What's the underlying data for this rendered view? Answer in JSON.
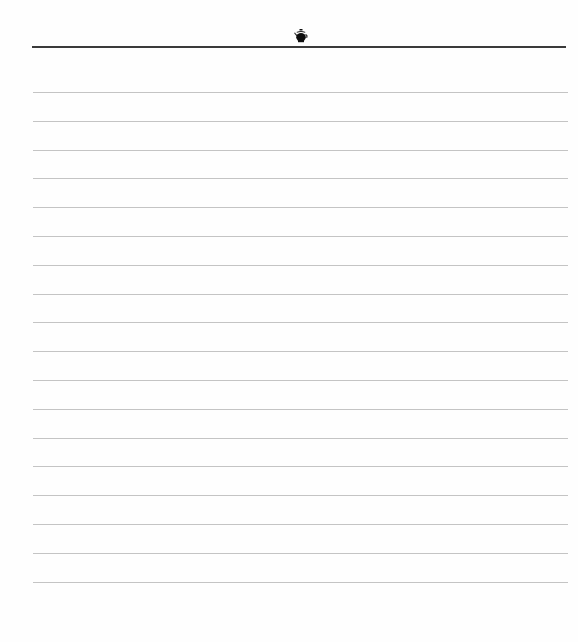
{
  "page": {
    "type": "lined-notepaper",
    "header_icon": "teapot-icon",
    "background_color": "#fefefe",
    "header_rule_color": "#3a3a3a",
    "ruled_line_color": "#c4c4c4",
    "ruled_line_count": 18,
    "ruled_line_start_y": 92,
    "ruled_line_spacing": 28.8,
    "lines": [
      "",
      "",
      "",
      "",
      "",
      "",
      "",
      "",
      "",
      "",
      "",
      "",
      "",
      "",
      "",
      "",
      "",
      ""
    ]
  }
}
